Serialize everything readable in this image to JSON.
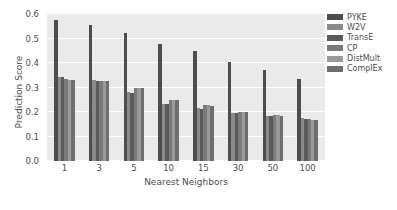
{
  "chart_data": {
    "type": "bar",
    "title": "",
    "xlabel": "Nearest Neighbors",
    "ylabel": "Prediction Score",
    "categories": [
      "1",
      "3",
      "5",
      "10",
      "15",
      "30",
      "50",
      "100"
    ],
    "ylim": [
      0.0,
      0.6
    ],
    "yticks": [
      "0.0",
      "0.1",
      "0.2",
      "0.3",
      "0.4",
      "0.5",
      "0.6"
    ],
    "ytick_values": [
      0.0,
      0.1,
      0.2,
      0.3,
      0.4,
      0.5,
      0.6
    ],
    "grid": true,
    "legend_position": "right",
    "series": [
      {
        "name": "PYKE",
        "color": "#4d4d4d",
        "values": [
          0.575,
          0.556,
          0.523,
          0.478,
          0.451,
          0.404,
          0.372,
          0.334
        ]
      },
      {
        "name": "W2V",
        "color": "#8a8a8a",
        "values": [
          0.344,
          0.33,
          0.28,
          0.234,
          0.216,
          0.196,
          0.184,
          0.174
        ]
      },
      {
        "name": "TransE",
        "color": "#5a5a5a",
        "values": [
          0.341,
          0.327,
          0.278,
          0.231,
          0.214,
          0.194,
          0.182,
          0.172
        ]
      },
      {
        "name": "CP",
        "color": "#7a7a7a",
        "values": [
          0.333,
          0.326,
          0.298,
          0.251,
          0.227,
          0.2,
          0.186,
          0.17
        ]
      },
      {
        "name": "DistMult",
        "color": "#9a9a9a",
        "values": [
          0.332,
          0.325,
          0.297,
          0.25,
          0.227,
          0.2,
          0.186,
          0.169
        ]
      },
      {
        "name": "ComplEx",
        "color": "#6e6e6e",
        "values": [
          0.331,
          0.325,
          0.296,
          0.249,
          0.226,
          0.199,
          0.185,
          0.169
        ]
      }
    ]
  },
  "legend": {
    "items": [
      {
        "label": "PYKE"
      },
      {
        "label": "W2V"
      },
      {
        "label": "TransE"
      },
      {
        "label": "CP"
      },
      {
        "label": "DistMult"
      },
      {
        "label": "ComplEx"
      }
    ]
  },
  "style": {
    "plot_background": "#eaeaea",
    "figure_background": "#ffffff",
    "gridline_color": "#ffffff",
    "text_color": "#4d4d4d"
  }
}
